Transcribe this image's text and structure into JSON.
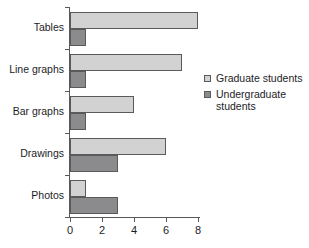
{
  "chart_data": {
    "type": "bar",
    "orientation": "horizontal",
    "title": "",
    "xlabel": "",
    "ylabel": "",
    "categories": [
      "Tables",
      "Line graphs",
      "Bar graphs",
      "Drawings",
      "Photos"
    ],
    "series": [
      {
        "name": "Graduate students",
        "values": [
          8,
          7,
          4,
          6,
          1
        ],
        "color": "#d2d2d2"
      },
      {
        "name": "Undergraduate students",
        "values": [
          1,
          1,
          1,
          3,
          3
        ],
        "color": "#8b8b8d"
      }
    ],
    "xlim": [
      0,
      8
    ],
    "xticks": [
      0,
      2,
      4,
      6,
      8
    ],
    "xtick_labels": [
      "0",
      "2",
      "4",
      "6",
      "8"
    ],
    "grid": false,
    "legend_position": "right"
  },
  "legend": {
    "entries": [
      {
        "label": "Graduate students",
        "swatch": "legend-swatch-graduate"
      },
      {
        "label": "Undergraduate students",
        "swatch": "legend-swatch-undergraduate"
      }
    ]
  },
  "axes": {
    "y_categories": [
      "Tables",
      "Line graphs",
      "Bar graphs",
      "Drawings",
      "Photos"
    ],
    "x_tick_labels": [
      "0",
      "2",
      "4",
      "6",
      "8"
    ]
  },
  "colors": {
    "graduate": "#d2d2d2",
    "undergraduate": "#8b8b8d",
    "axis": "#59595b",
    "bar_border": "#5a5a5c",
    "text": "#1d1d1f",
    "background": "#ffffff"
  }
}
